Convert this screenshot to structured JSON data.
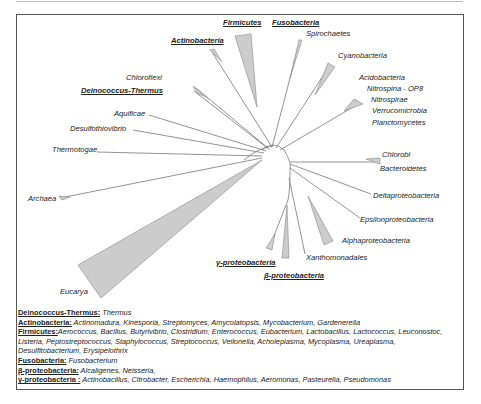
{
  "tree": {
    "labels": {
      "firmicutes": "Firmicutes",
      "fusobacteria": "Fusobacteria",
      "spirochaetes": "Spirochaetes",
      "actinobacteria": "Actinobacteria",
      "cyanobacteria": "Cyanobacteria",
      "chloroflexi": "Chloroflexi",
      "deinococcus_thermus": "Deinococcus-Thermus",
      "acidobacteria": "Acidobacteria",
      "nitrospina": "Nitrospina - OP8",
      "nitrospirae": "Nitrospirae",
      "verrucomicrobia": "Verrucomicrobia",
      "planctomycetes": "Planctomycetes",
      "aquificae": "Aquificae",
      "desulfothiovibrio": "Desulfothiovibrio",
      "thermotogae": "Thermotogae",
      "chlorobi": "Chlorobi",
      "bacteroidetes": "Bacteroidetes",
      "deltaproteobacteria": "Deltaproteobacteria",
      "archaea": "Archaea",
      "epsilonproteobacteria": "Epsilonproteobacteria",
      "alphaproteobacteria": "Alphaproteobacteria",
      "xanthomonadales": "Xanthomonadales",
      "gammaproteobacteria": "γ-proteobacteria",
      "betaproteobacteria": "β-proteobacteria",
      "eucarya": "Eucarya"
    },
    "colors": {
      "branch": "#777777",
      "wedge_fill": "#cccccc",
      "wedge_stroke": "#888888"
    }
  },
  "legend": [
    {
      "key": "Deinococcus-Thermus:",
      "value": " Thermus"
    },
    {
      "key": "Actinobacteria:",
      "value": " Actinomadura, Kinesporia, Streptomyces, Amycolatopsis, Mycobacterium, Gardenerella"
    },
    {
      "key": "Firmicutes:",
      "value": "Aerococcus, Bacillus, Butyrivibrio, Clostridium, Enterococcus, Eubacterium, Lactobacillus, Lactococcus, Leuconostoc,"
    },
    {
      "key": "",
      "value": "Listeria, Peptostreptococcus, Staphylococcus, Streptococcus, Veilonella, Acholeplasma, Mycoplasma, Ureaplasma,"
    },
    {
      "key": "",
      "value": "Desulfitobacterium, Erysipelothrix"
    },
    {
      "key": "Fusobacteria:",
      "value": " Fusobacterium"
    },
    {
      "key": "β-proteobacteria:",
      "value": " Alcaligenes, Neisseria,"
    },
    {
      "key": "γ-proteobacteria :",
      "value": " Actinobacillus, Citrobacter, Escherichia, Haemophilus, Aeromonas, Pasteurella, Pseudomonas"
    }
  ]
}
